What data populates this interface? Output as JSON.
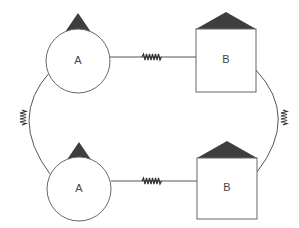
{
  "diagram": {
    "title": "",
    "nodes": [
      {
        "id": "top-left",
        "label": "A",
        "shape": "circle",
        "cap": "triangle"
      },
      {
        "id": "top-right",
        "label": "B",
        "shape": "square",
        "cap": "roof"
      },
      {
        "id": "bottom-left",
        "label": "A",
        "shape": "circle",
        "cap": "triangle"
      },
      {
        "id": "bottom-right",
        "label": "B",
        "shape": "square",
        "cap": "roof"
      }
    ],
    "edges": [
      {
        "from": "top-left",
        "to": "top-right",
        "type": "spring"
      },
      {
        "from": "bottom-left",
        "to": "bottom-right",
        "type": "spring"
      },
      {
        "from": "top-left",
        "to": "bottom-left",
        "type": "spring-arc"
      },
      {
        "from": "top-right",
        "to": "bottom-right",
        "type": "spring-arc"
      }
    ],
    "colors": {
      "cap_fill": "#3e3e3e",
      "outline": "#666666",
      "label": "#444444"
    }
  }
}
